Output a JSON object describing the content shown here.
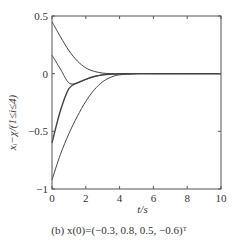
{
  "chart_data": {
    "type": "line",
    "title": "",
    "caption": "(b) x(0)=(−0.3, 0.8, 0.5, −0.6)ᵀ",
    "xlabel": "t/s",
    "ylabel": "xᵢ−χ/(1≤i≤4)",
    "xlim": [
      0,
      10
    ],
    "ylim": [
      -1,
      0.5
    ],
    "xticks": [
      0,
      2,
      4,
      6,
      8,
      10
    ],
    "yticks": [
      -1,
      -0.5,
      0,
      0.5
    ],
    "ytick_labels": [
      "−1",
      "−0.5",
      "0",
      "0.5"
    ],
    "grid": false,
    "legend": null,
    "x": [
      0,
      0.5,
      1,
      1.5,
      2,
      2.5,
      3,
      3.5,
      4,
      5,
      6,
      8,
      10
    ],
    "series": [
      {
        "name": "x1−χ",
        "values": [
          0.45,
          0.32,
          0.2,
          0.11,
          0.05,
          0.02,
          0.005,
          0.0,
          -0.002,
          0,
          0,
          0,
          0
        ]
      },
      {
        "name": "x2−χ",
        "values": [
          0.16,
          0.04,
          -0.08,
          -0.08,
          -0.05,
          -0.025,
          -0.01,
          -0.004,
          -0.001,
          0,
          0,
          0,
          0
        ]
      },
      {
        "name": "x3−χ",
        "values": [
          -0.6,
          -0.32,
          -0.13,
          -0.08,
          -0.05,
          -0.025,
          -0.01,
          -0.004,
          -0.001,
          0,
          0,
          0,
          0
        ]
      },
      {
        "name": "x4−χ",
        "values": [
          -0.92,
          -0.7,
          -0.52,
          -0.37,
          -0.24,
          -0.14,
          -0.07,
          -0.03,
          -0.01,
          0,
          0,
          0,
          0
        ]
      }
    ]
  },
  "layout": {
    "plot_left": 52,
    "plot_right": 221,
    "plot_top": 16,
    "plot_bottom": 189,
    "line_color": "#444444"
  }
}
